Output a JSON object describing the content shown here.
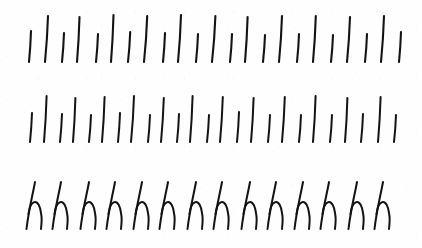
{
  "sheet": {
    "kind": "handwriting-practice-scan",
    "width": 422,
    "height": 248,
    "background_color": "#fefefe",
    "ink_color": "#131316",
    "title": "Handwriting Practice Sheet",
    "description": "Scanned cursive handwriting exercise: two rows of alternating short and long slanted pen strokes followed by one row of joined lowercase cursive letter h."
  },
  "rows": [
    {
      "id": "stroke-row-1",
      "label": "Row 1 - alternating short and long slanted strokes",
      "kind": "strokes",
      "baseline_y": 62,
      "stroke_width": 2.1,
      "count": 23,
      "strokes": [
        {
          "x": 29,
          "top_y": 31,
          "bottom_y": 62,
          "lean": 2.0,
          "length": "short"
        },
        {
          "x": 45,
          "top_y": 16,
          "bottom_y": 62,
          "lean": 3.0,
          "length": "long"
        },
        {
          "x": 62,
          "top_y": 33,
          "bottom_y": 62,
          "lean": 2.0,
          "length": "short"
        },
        {
          "x": 77,
          "top_y": 17,
          "bottom_y": 62,
          "lean": 2.5,
          "length": "long"
        },
        {
          "x": 96,
          "top_y": 34,
          "bottom_y": 62,
          "lean": 2.0,
          "length": "short"
        },
        {
          "x": 111,
          "top_y": 15,
          "bottom_y": 62,
          "lean": 2.5,
          "length": "long"
        },
        {
          "x": 128,
          "top_y": 32,
          "bottom_y": 62,
          "lean": 2.2,
          "length": "short"
        },
        {
          "x": 144,
          "top_y": 16,
          "bottom_y": 62,
          "lean": 3.2,
          "length": "long"
        },
        {
          "x": 163,
          "top_y": 33,
          "bottom_y": 62,
          "lean": 2.0,
          "length": "short"
        },
        {
          "x": 178,
          "top_y": 15,
          "bottom_y": 62,
          "lean": 3.0,
          "length": "long"
        },
        {
          "x": 196,
          "top_y": 34,
          "bottom_y": 62,
          "lean": 2.0,
          "length": "short"
        },
        {
          "x": 212,
          "top_y": 16,
          "bottom_y": 62,
          "lean": 3.4,
          "length": "long"
        },
        {
          "x": 230,
          "top_y": 34,
          "bottom_y": 62,
          "lean": 2.0,
          "length": "short"
        },
        {
          "x": 245,
          "top_y": 17,
          "bottom_y": 62,
          "lean": 2.6,
          "length": "long"
        },
        {
          "x": 263,
          "top_y": 35,
          "bottom_y": 62,
          "lean": 2.0,
          "length": "short"
        },
        {
          "x": 279,
          "top_y": 16,
          "bottom_y": 62,
          "lean": 3.0,
          "length": "long"
        },
        {
          "x": 297,
          "top_y": 34,
          "bottom_y": 62,
          "lean": 2.0,
          "length": "short"
        },
        {
          "x": 313,
          "top_y": 16,
          "bottom_y": 62,
          "lean": 2.8,
          "length": "long"
        },
        {
          "x": 331,
          "top_y": 35,
          "bottom_y": 62,
          "lean": 2.0,
          "length": "short"
        },
        {
          "x": 347,
          "top_y": 17,
          "bottom_y": 62,
          "lean": 3.0,
          "length": "long"
        },
        {
          "x": 365,
          "top_y": 34,
          "bottom_y": 62,
          "lean": 2.0,
          "length": "short"
        },
        {
          "x": 381,
          "top_y": 16,
          "bottom_y": 62,
          "lean": 3.0,
          "length": "long"
        },
        {
          "x": 399,
          "top_y": 32,
          "bottom_y": 62,
          "lean": 2.0,
          "length": "short"
        }
      ]
    },
    {
      "id": "stroke-row-2",
      "label": "Row 2 - alternating short and long slanted strokes, denser spacing",
      "kind": "strokes",
      "baseline_y": 60,
      "stroke_width": 2.0,
      "count": 25,
      "strokes": [
        {
          "x": 30,
          "top_y": 31,
          "bottom_y": 60,
          "lean": 2.0,
          "length": "short"
        },
        {
          "x": 44,
          "top_y": 14,
          "bottom_y": 60,
          "lean": 2.6,
          "length": "long"
        },
        {
          "x": 60,
          "top_y": 32,
          "bottom_y": 60,
          "lean": 2.0,
          "length": "short"
        },
        {
          "x": 73,
          "top_y": 16,
          "bottom_y": 60,
          "lean": 2.4,
          "length": "long"
        },
        {
          "x": 89,
          "top_y": 33,
          "bottom_y": 60,
          "lean": 2.0,
          "length": "short"
        },
        {
          "x": 102,
          "top_y": 15,
          "bottom_y": 60,
          "lean": 2.6,
          "length": "long"
        },
        {
          "x": 118,
          "top_y": 31,
          "bottom_y": 60,
          "lean": 2.0,
          "length": "short"
        },
        {
          "x": 131,
          "top_y": 14,
          "bottom_y": 60,
          "lean": 3.0,
          "length": "long"
        },
        {
          "x": 148,
          "top_y": 33,
          "bottom_y": 60,
          "lean": 2.0,
          "length": "short"
        },
        {
          "x": 161,
          "top_y": 16,
          "bottom_y": 60,
          "lean": 2.8,
          "length": "long"
        },
        {
          "x": 177,
          "top_y": 32,
          "bottom_y": 60,
          "lean": 2.0,
          "length": "short"
        },
        {
          "x": 190,
          "top_y": 14,
          "bottom_y": 60,
          "lean": 2.6,
          "length": "long"
        },
        {
          "x": 207,
          "top_y": 33,
          "bottom_y": 60,
          "lean": 2.0,
          "length": "short"
        },
        {
          "x": 220,
          "top_y": 15,
          "bottom_y": 60,
          "lean": 2.8,
          "length": "long"
        },
        {
          "x": 237,
          "top_y": 30,
          "bottom_y": 60,
          "lean": 2.0,
          "length": "short"
        },
        {
          "x": 251,
          "top_y": 16,
          "bottom_y": 60,
          "lean": 2.6,
          "length": "long"
        },
        {
          "x": 268,
          "top_y": 33,
          "bottom_y": 60,
          "lean": 2.0,
          "length": "short"
        },
        {
          "x": 282,
          "top_y": 15,
          "bottom_y": 60,
          "lean": 2.8,
          "length": "long"
        },
        {
          "x": 299,
          "top_y": 33,
          "bottom_y": 60,
          "lean": 2.0,
          "length": "short"
        },
        {
          "x": 313,
          "top_y": 14,
          "bottom_y": 60,
          "lean": 2.6,
          "length": "long"
        },
        {
          "x": 330,
          "top_y": 33,
          "bottom_y": 60,
          "lean": 2.0,
          "length": "short"
        },
        {
          "x": 345,
          "top_y": 16,
          "bottom_y": 60,
          "lean": 2.4,
          "length": "long"
        },
        {
          "x": 361,
          "top_y": 32,
          "bottom_y": 60,
          "lean": 2.0,
          "length": "short"
        },
        {
          "x": 378,
          "top_y": 15,
          "bottom_y": 60,
          "lean": 2.6,
          "length": "long"
        },
        {
          "x": 394,
          "top_y": 33,
          "bottom_y": 60,
          "lean": 2.0,
          "length": "short"
        }
      ]
    },
    {
      "id": "letter-row-3",
      "label": "Row 3 - joined cursive lowercase letter h",
      "kind": "letters",
      "letter": "h",
      "baseline_y": 62,
      "ascender_y": 16,
      "x_height_y": 38,
      "stroke_width": 2.0,
      "count": 14,
      "letters": [
        {
          "x": 26,
          "char": "h"
        },
        {
          "x": 52,
          "char": "h"
        },
        {
          "x": 80,
          "char": "h"
        },
        {
          "x": 106,
          "char": "h"
        },
        {
          "x": 133,
          "char": "h"
        },
        {
          "x": 159,
          "char": "h"
        },
        {
          "x": 187,
          "char": "h"
        },
        {
          "x": 213,
          "char": "h"
        },
        {
          "x": 241,
          "char": "h"
        },
        {
          "x": 267,
          "char": "h"
        },
        {
          "x": 294,
          "char": "h"
        },
        {
          "x": 320,
          "char": "h"
        },
        {
          "x": 348,
          "char": "h"
        },
        {
          "x": 374,
          "char": "h"
        }
      ]
    }
  ]
}
